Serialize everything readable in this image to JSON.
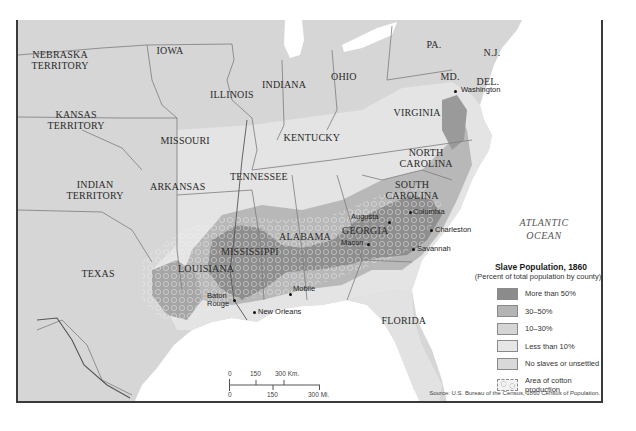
{
  "map": {
    "title": "Slave Population, 1860",
    "states": [
      {
        "id": "nebraska",
        "label": "NEBRASKA\nTERRITORY",
        "x": 58,
        "y": 60
      },
      {
        "id": "iowa",
        "label": "IOWA",
        "x": 168,
        "y": 50
      },
      {
        "id": "kansas",
        "label": "KANSAS\nTERRITORY",
        "x": 74,
        "y": 120
      },
      {
        "id": "illinois",
        "label": "ILLINOIS",
        "x": 230,
        "y": 94
      },
      {
        "id": "indiana",
        "label": "INDIANA",
        "x": 282,
        "y": 84
      },
      {
        "id": "ohio",
        "label": "OHIO",
        "x": 342,
        "y": 76
      },
      {
        "id": "pa",
        "label": "PA.",
        "x": 432,
        "y": 44
      },
      {
        "id": "nj",
        "label": "N.J.",
        "x": 490,
        "y": 52
      },
      {
        "id": "md",
        "label": "MD.",
        "x": 448,
        "y": 76
      },
      {
        "id": "del",
        "label": "DEL.",
        "x": 486,
        "y": 81
      },
      {
        "id": "missouri",
        "label": "MISSOURI",
        "x": 183,
        "y": 140
      },
      {
        "id": "kentucky",
        "label": "KENTUCKY",
        "x": 310,
        "y": 137
      },
      {
        "id": "virginia",
        "label": "VIRGINIA",
        "x": 415,
        "y": 112
      },
      {
        "id": "indian",
        "label": "INDIAN\nTERRITORY",
        "x": 93,
        "y": 190
      },
      {
        "id": "arkansas",
        "label": "ARKANSAS",
        "x": 176,
        "y": 186
      },
      {
        "id": "tennessee",
        "label": "TENNESSEE",
        "x": 257,
        "y": 176
      },
      {
        "id": "north_carolina",
        "label": "NORTH\nCAROLINA",
        "x": 424,
        "y": 158
      },
      {
        "id": "south_carolina",
        "label": "SOUTH\nCAROLINA",
        "x": 410,
        "y": 190
      },
      {
        "id": "georgia",
        "label": "GEORGIA",
        "x": 363,
        "y": 230
      },
      {
        "id": "alabama",
        "label": "ALABAMA",
        "x": 303,
        "y": 236
      },
      {
        "id": "mississippi",
        "label": "MISSISSIPPI",
        "x": 248,
        "y": 251
      },
      {
        "id": "louisiana",
        "label": "LOUISIANA",
        "x": 204,
        "y": 268
      },
      {
        "id": "texas",
        "label": "TEXAS",
        "x": 96,
        "y": 273
      },
      {
        "id": "florida",
        "label": "FLORIDA",
        "x": 402,
        "y": 320
      }
    ],
    "cities": [
      {
        "name": "Washington",
        "x": 453,
        "y": 91,
        "dx": 6,
        "dy": -1
      },
      {
        "name": "Augusta",
        "x": 387,
        "y": 222,
        "dx": -38,
        "dy": -5
      },
      {
        "name": "Columbia",
        "x": 408,
        "y": 212,
        "dx": 3,
        "dy": 0
      },
      {
        "name": "Charleston",
        "x": 429,
        "y": 230,
        "dx": 4,
        "dy": 0
      },
      {
        "name": "Macon",
        "x": 366,
        "y": 244,
        "dx": -27,
        "dy": -1
      },
      {
        "name": "Savannah",
        "x": 411,
        "y": 249,
        "dx": 4,
        "dy": 0
      },
      {
        "name": "Mobile",
        "x": 288,
        "y": 294,
        "dx": 3,
        "dy": -5
      },
      {
        "name": "Baton\nRouge",
        "x": 232,
        "y": 300,
        "dx": -27,
        "dy": -4
      },
      {
        "name": "New Orleans",
        "x": 252,
        "y": 312,
        "dx": 4,
        "dy": 0
      }
    ],
    "ocean_label": "ATLANTIC\nOCEAN"
  },
  "legend": {
    "title": "Slave Population, 1860",
    "subtitle": "(Percent of total population by county)",
    "items": [
      {
        "label": "More than 50%",
        "color": "#8c8c8c"
      },
      {
        "label": "30–50%",
        "color": "#b4b4b4"
      },
      {
        "label": "10–30%",
        "color": "#d5d5d5"
      },
      {
        "label": "Less than 10%",
        "color": "#e6e6e6"
      },
      {
        "label": "No slaves or unsettled",
        "color": "#d9d9d9"
      },
      {
        "label": "Area of cotton\nproduction",
        "color": "#f2f2f2",
        "pattern": "cotton"
      }
    ]
  },
  "scale": {
    "km_labels": [
      "0",
      "150",
      "300 Km."
    ],
    "mi_labels": [
      "0",
      "150",
      "300 Mi."
    ]
  },
  "source": "Source: U.S. Bureau of the Census, 1860 Census of Population.",
  "colors": {
    "land_free": "#d9d9d9",
    "land_light": "#e8e8e8",
    "slave_high": "#8a8a8a",
    "slave_mid": "#adadad",
    "slave_low": "#cacaca",
    "water": "#ffffff",
    "border": "#7a7a7a"
  }
}
